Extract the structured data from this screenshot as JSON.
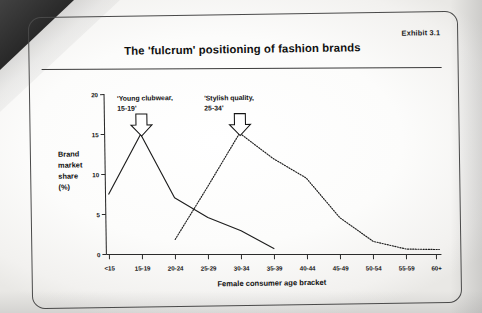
{
  "exhibit": {
    "tag": "Exhibit 3.1",
    "title": "The 'fulcrum' positioning of fashion brands"
  },
  "chart_data": {
    "type": "line",
    "title": "The 'fulcrum' positioning of fashion brands",
    "xlabel": "Female consumer age bracket",
    "ylabel": "Brand market share (%)",
    "ylabel_lines": [
      "Brand",
      "market",
      "share",
      "(%)"
    ],
    "categories": [
      "<15",
      "15-19",
      "20-24",
      "25-29",
      "30-34",
      "35-39",
      "40-44",
      "45-49",
      "50-54",
      "55-59",
      "60+"
    ],
    "yticks": [
      "0",
      "5",
      "10",
      "15",
      "20"
    ],
    "ylim": [
      0,
      20
    ],
    "grid": false,
    "legend": "none",
    "series": [
      {
        "name": "Young clubwear brand",
        "style": "solid",
        "x": [
          "<15",
          "15-19",
          "20-24",
          "25-29",
          "30-34",
          "35-39"
        ],
        "values": [
          7.5,
          15.0,
          7.0,
          4.5,
          2.8,
          0.5
        ]
      },
      {
        "name": "Stylish quality brand",
        "style": "dotted",
        "x": [
          "20-24",
          "25-29",
          "30-34",
          "35-39",
          "40-44",
          "45-49",
          "50-54",
          "55-59",
          "60+"
        ],
        "values": [
          1.8,
          8.3,
          15.0,
          11.8,
          9.3,
          4.3,
          1.3,
          0.3,
          0.2
        ]
      }
    ],
    "annotations": [
      {
        "id": "young-clubwear",
        "lines": [
          "'Young clubwear,",
          "15-19'"
        ],
        "points_to_category": "15-19",
        "marker": "down-arrow"
      },
      {
        "id": "stylish-quality",
        "lines": [
          "'Stylish quality,",
          "25-34'"
        ],
        "points_to_category": "30-34",
        "marker": "down-arrow"
      }
    ]
  },
  "colors": {
    "ink": "#1e1e1e",
    "frame": "#4a4a4a",
    "paper": "#fdfdfd"
  }
}
